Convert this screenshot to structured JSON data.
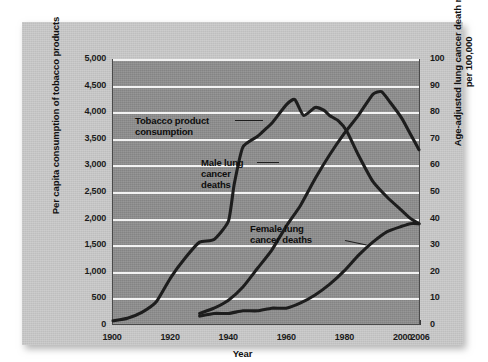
{
  "figure": {
    "background_color": "#ffffff",
    "card_color": "#c9c9c9",
    "plot_background_color": "#8d8d8d",
    "gridline_color": "#f2f2f2",
    "curve_color": "#1d1d1d"
  },
  "chart_data": {
    "type": "line",
    "title": "",
    "xlabel": "Year",
    "ylabel": "Per capita consumption of tobacco products",
    "y2label": "Age-adjusted lung cancer death rates, per 100,000",
    "xlim": [
      1900,
      2006
    ],
    "ylim": [
      0,
      5000
    ],
    "y2lim": [
      0,
      100
    ],
    "grid": true,
    "legend": "annotations-inline",
    "xticks": [
      1900,
      1920,
      1940,
      1960,
      1980,
      2000,
      2006
    ],
    "xtick_labels": [
      "1900",
      "1920",
      "1940",
      "1960",
      "1980",
      "2000",
      "2006"
    ],
    "yticks": [
      0,
      500,
      1000,
      1500,
      2000,
      2500,
      3000,
      3500,
      4000,
      4500,
      5000
    ],
    "ytick_labels": [
      "0",
      "500",
      "1,000",
      "1,500",
      "2,000",
      "2,500",
      "3,000",
      "3,500",
      "4,000",
      "4,500",
      "5,000"
    ],
    "y2ticks": [
      0,
      10,
      20,
      30,
      40,
      50,
      60,
      70,
      80,
      90,
      100
    ],
    "y2tick_labels": [
      "0",
      "10",
      "20",
      "30",
      "40",
      "50",
      "60",
      "70",
      "80",
      "90",
      "100"
    ],
    "series": [
      {
        "name": "Tobacco product consumption",
        "axis": "left",
        "x": [
          1900,
          1905,
          1910,
          1915,
          1920,
          1925,
          1930,
          1935,
          1940,
          1942,
          1945,
          1950,
          1953,
          1955,
          1960,
          1963,
          1966,
          1970,
          1973,
          1975,
          1978,
          1981,
          1985,
          1990,
          1995,
          2000,
          2003,
          2006
        ],
        "values": [
          60,
          110,
          220,
          420,
          880,
          1250,
          1550,
          1600,
          1950,
          2650,
          3350,
          3550,
          3700,
          3800,
          4150,
          4250,
          3950,
          4100,
          4050,
          3950,
          3850,
          3650,
          3200,
          2700,
          2400,
          2150,
          2000,
          1900
        ]
      },
      {
        "name": "Male lung cancer deaths",
        "axis": "right",
        "x": [
          1930,
          1935,
          1940,
          1945,
          1950,
          1955,
          1960,
          1965,
          1970,
          1975,
          1980,
          1985,
          1990,
          1993,
          1996,
          2000,
          2003,
          2006
        ],
        "values": [
          4,
          6,
          9,
          14,
          21,
          28,
          37,
          45,
          55,
          64,
          72,
          79,
          87,
          88,
          84,
          78,
          72,
          66
        ]
      },
      {
        "name": "Female lung cancer deaths",
        "axis": "right",
        "x": [
          1930,
          1935,
          1940,
          1945,
          1950,
          1955,
          1960,
          1965,
          1970,
          1975,
          1980,
          1985,
          1990,
          1995,
          2000,
          2003,
          2006
        ],
        "values": [
          3,
          4,
          4,
          5,
          5,
          6,
          6,
          8,
          11,
          15,
          20,
          26,
          31,
          35,
          37,
          38,
          38
        ]
      }
    ],
    "annotations": [
      {
        "text": "Tobacco product\nconsumption",
        "series": "Tobacco product consumption"
      },
      {
        "text": "Male lung\ncancer\ndeaths",
        "series": "Male lung cancer deaths"
      },
      {
        "text": "Female lung\ncancer deaths",
        "series": "Female lung cancer deaths"
      }
    ]
  }
}
